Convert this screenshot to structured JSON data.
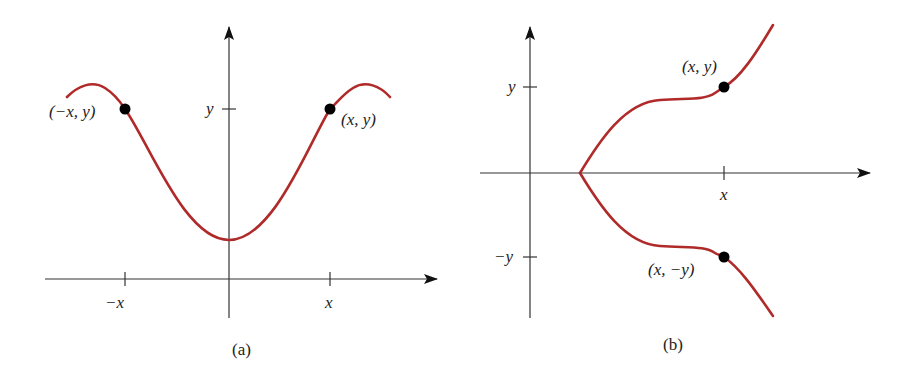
{
  "colors": {
    "curve": "#b02a2a",
    "axis": "#222222",
    "point": "#000000",
    "background": "#ffffff"
  },
  "panels": [
    {
      "id": "a",
      "caption": "(a)",
      "description": "Graph symmetric with respect to the y-axis",
      "tick_labels": {
        "neg_x": "−x",
        "pos_x": "x",
        "y": "y"
      },
      "points": [
        {
          "label": "(−x, y)"
        },
        {
          "label": "(x, y)"
        }
      ]
    },
    {
      "id": "b",
      "caption": "(b)",
      "description": "Graph symmetric with respect to the x-axis",
      "tick_labels": {
        "x": "x",
        "pos_y": "y",
        "neg_y": "−y"
      },
      "points": [
        {
          "label": "(x, y)"
        },
        {
          "label": "(x, −y)"
        }
      ]
    }
  ]
}
